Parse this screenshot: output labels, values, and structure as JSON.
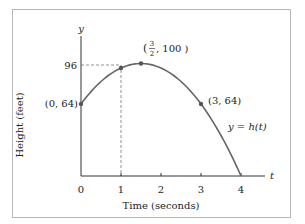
{
  "chart_data": {
    "type": "line",
    "title": "",
    "xlabel": "Time (seconds)",
    "ylabel": "Height (feet)",
    "x_axis_symbol": "t",
    "y_axis_symbol": "y",
    "x_ticks": [
      "0",
      "1",
      "2",
      "3",
      "4"
    ],
    "y_ticks": [
      "96"
    ],
    "xlim": [
      0,
      4.6
    ],
    "ylim": [
      0,
      115
    ],
    "grid": false,
    "legend": null,
    "curve_label": "y = h(t)",
    "function": "h(t) = -16t^2 + 48t + 64",
    "series": [
      {
        "name": "y = h(t)",
        "x": [
          0,
          0.5,
          1,
          1.5,
          2,
          2.5,
          3,
          3.5,
          4
        ],
        "y": [
          64,
          84,
          96,
          100,
          96,
          84,
          64,
          36,
          0
        ]
      }
    ],
    "points": [
      {
        "x": 0,
        "y": 64,
        "label": "(0, 64)"
      },
      {
        "x": 1,
        "y": 96,
        "label": ""
      },
      {
        "x": 1.5,
        "y": 100,
        "label": "(3/2, 100)"
      },
      {
        "x": 3,
        "y": 64,
        "label": "(3, 64)"
      }
    ],
    "annotations": [
      {
        "type": "dashed-guide",
        "from": [
          0,
          96
        ],
        "to": [
          1,
          96
        ]
      },
      {
        "type": "dashed-guide",
        "from": [
          1,
          96
        ],
        "to": [
          1,
          0
        ]
      }
    ]
  },
  "labels": {
    "xlabel": "Time (seconds)",
    "ylabel": "Height (feet)",
    "t": "t",
    "y": "y",
    "tick0": "0",
    "tick1": "1",
    "tick2": "2",
    "tick3": "3",
    "tick4": "4",
    "ytick96": "96",
    "p0": "(0, 64)",
    "p3": "(3, 64)",
    "vertex_open": "(",
    "vertex_num": "3",
    "vertex_den": "2",
    "vertex_rest": ", 100 )",
    "curve": "y = h(t)"
  },
  "colors": {
    "curve": "#666666",
    "axis": "#333333",
    "point": "#555555",
    "frame": "#b8b8b8"
  }
}
